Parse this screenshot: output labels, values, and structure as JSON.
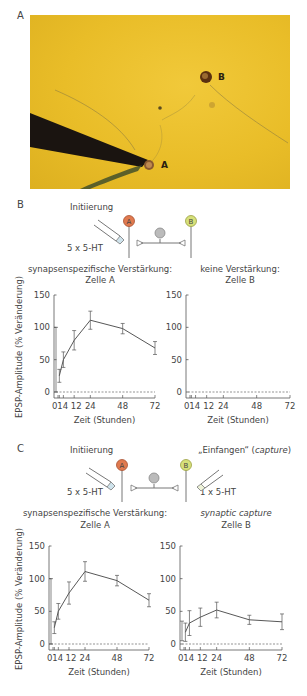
{
  "panels": {
    "A": {
      "label": "A",
      "photo": {
        "cell_a_label": "A",
        "cell_b_label": "B",
        "background_color": "#e9bd28"
      }
    },
    "B": {
      "label": "B",
      "schematic": {
        "title_left": "Initiierung",
        "dose_left": "5 x 5-HT",
        "neuron_a": "A",
        "neuron_b": "B",
        "neuron_a_color": "#e07a4f",
        "neuron_b_color": "#d6e07a"
      },
      "left_title_line1": "synapsenspezifische Verstärkung:",
      "left_title_line2": "Zelle A",
      "right_title_line1": "keine Verstärkung:",
      "right_title_line2": "Zelle B"
    },
    "C": {
      "label": "C",
      "schematic": {
        "title_left": "Initiierung",
        "title_right_prefix": "„Einfangen“ (",
        "title_right_italic": "capture",
        "title_right_suffix": ")",
        "dose_left": "5 x 5-HT",
        "dose_right": "1 x 5-HT",
        "neuron_a": "A",
        "neuron_b": "B"
      },
      "left_title_line1": "synapsenspezifische Verstärkung:",
      "left_title_line2": "Zelle A",
      "right_title_line1": "synaptic capture",
      "right_title_line2": "Zelle B"
    }
  },
  "axes": {
    "ylabel": "EPSP-Amplitude (% Veränderung)",
    "xlabel": "Zeit (Stunden)",
    "yticks": [
      "0",
      "50",
      "100",
      "150"
    ],
    "xticks": [
      "0",
      "1",
      "4",
      "12",
      "24",
      "48",
      "72"
    ]
  },
  "chart_data": [
    {
      "type": "line",
      "title": "synapsenspezifische Verstärkung: Zelle A",
      "panel": "B",
      "xlabel": "Zeit (Stunden)",
      "ylabel": "EPSP-Amplitude (% Veränderung)",
      "x": [
        0,
        1,
        4,
        12,
        24,
        48,
        72
      ],
      "values": [
        50,
        25,
        50,
        80,
        111,
        98,
        68
      ],
      "errors": [
        50,
        10,
        12,
        15,
        14,
        8,
        10
      ],
      "ylim": [
        0,
        150
      ],
      "xlim": [
        0,
        72
      ],
      "baseline_dashed": 0
    },
    {
      "type": "line",
      "title": "keine Verstärkung: Zelle B",
      "panel": "B",
      "xlabel": "Zeit (Stunden)",
      "ylabel": "EPSP-Amplitude (% Veränderung)",
      "x": [],
      "values": [],
      "ylim": [
        0,
        150
      ],
      "xlim": [
        0,
        72
      ],
      "baseline_dashed": 0
    },
    {
      "type": "line",
      "title": "synapsenspezifische Verstärkung: Zelle A",
      "panel": "C",
      "xlabel": "Zeit (Stunden)",
      "ylabel": "EPSP-Amplitude (% Veränderung)",
      "x": [
        0,
        1,
        4,
        12,
        24,
        48,
        72
      ],
      "values": [
        50,
        25,
        50,
        78,
        111,
        97,
        67
      ],
      "errors": [
        50,
        9,
        12,
        17,
        15,
        8,
        10
      ],
      "ylim": [
        0,
        150
      ],
      "xlim": [
        0,
        72
      ],
      "baseline_dashed": 0
    },
    {
      "type": "line",
      "title": "synaptic capture: Zelle B",
      "panel": "C",
      "xlabel": "Zeit (Stunden)",
      "ylabel": "EPSP-Amplitude (% Veränderung)",
      "x": [
        0,
        1,
        4,
        12,
        24,
        48,
        72
      ],
      "values": [
        20,
        18,
        32,
        41,
        52,
        37,
        34
      ],
      "errors": [
        15,
        14,
        19,
        14,
        12,
        7,
        12
      ],
      "ylim": [
        0,
        150
      ],
      "xlim": [
        0,
        72
      ],
      "baseline_dashed": 0
    }
  ]
}
